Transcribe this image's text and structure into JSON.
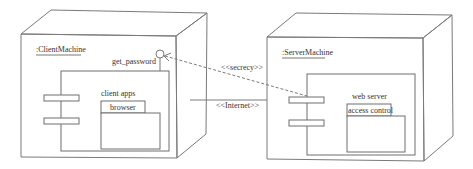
{
  "diagram": {
    "type": "uml-deployment",
    "nodes": [
      {
        "id": "client",
        "label": ":ClientMachine",
        "component": {
          "label": "client apps",
          "package_label": "browser",
          "provided_interface": "get_password"
        }
      },
      {
        "id": "server",
        "label": ":ServerMachine",
        "component": {
          "label": "web server",
          "package_label": "access control"
        }
      }
    ],
    "connections": [
      {
        "from": "client",
        "to": "server",
        "stereotype": "<<Internet>>",
        "style": "solid"
      },
      {
        "from": "server",
        "to": "client.get_password",
        "stereotype": "<<secrecy>>",
        "style": "dashed-dependency"
      }
    ],
    "colors": {
      "line": "#7a7a7a",
      "text": "#333333",
      "background": "#ffffff"
    }
  }
}
